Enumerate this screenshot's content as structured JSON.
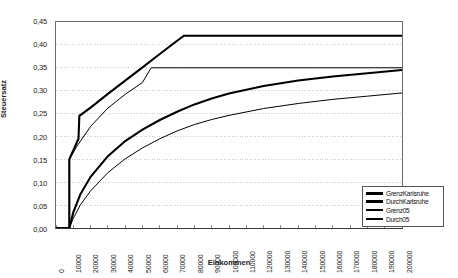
{
  "chart_data": {
    "type": "line",
    "title": "",
    "xlabel": "Einkommen",
    "ylabel": "Steuersatz",
    "xlim": [
      0,
      200000
    ],
    "ylim": [
      0,
      0.45
    ],
    "grid": "horizontal-dotted",
    "legend_position": "bottom-right",
    "x_ticks": [
      0,
      10000,
      20000,
      30000,
      40000,
      50000,
      60000,
      70000,
      80000,
      90000,
      100000,
      110000,
      120000,
      130000,
      140000,
      150000,
      160000,
      170000,
      180000,
      190000,
      200000
    ],
    "x_tick_labels": [
      "0",
      "10000",
      "20000",
      "30000",
      "40000",
      "50000",
      "60000",
      "70000",
      "80000",
      "90000",
      "100000",
      "110000",
      "120000",
      "130000",
      "140000",
      "150000",
      "160000",
      "170000",
      "180000",
      "190000",
      "200000"
    ],
    "y_ticks": [
      0,
      0.05,
      0.1,
      0.15,
      0.2,
      0.25,
      0.3,
      0.35,
      0.4,
      0.45
    ],
    "y_tick_labels": [
      "0,00",
      "0,05",
      "0,10",
      "0,15",
      "0,20",
      "0,25",
      "0,30",
      "0,35",
      "0,40",
      "0,45"
    ],
    "series": [
      {
        "name": "GrenzKarlsruhe",
        "color": "#000000",
        "width": 2.1,
        "points": [
          [
            0,
            0
          ],
          [
            7700,
            0
          ],
          [
            7700,
            0.15
          ],
          [
            13000,
            0.195
          ],
          [
            13500,
            0.245
          ],
          [
            20000,
            0.263
          ],
          [
            30000,
            0.293
          ],
          [
            40000,
            0.322
          ],
          [
            50000,
            0.351
          ],
          [
            60000,
            0.38
          ],
          [
            70000,
            0.409
          ],
          [
            74000,
            0.42
          ],
          [
            90000,
            0.42
          ],
          [
            120000,
            0.42
          ],
          [
            160000,
            0.42
          ],
          [
            200000,
            0.42
          ]
        ]
      },
      {
        "name": "DurchKarlsruhe",
        "color": "#000000",
        "width": 2.1,
        "points": [
          [
            0,
            0
          ],
          [
            7700,
            0
          ],
          [
            10000,
            0.034
          ],
          [
            14000,
            0.073
          ],
          [
            20000,
            0.112
          ],
          [
            30000,
            0.157
          ],
          [
            40000,
            0.19
          ],
          [
            50000,
            0.215
          ],
          [
            60000,
            0.236
          ],
          [
            70000,
            0.254
          ],
          [
            80000,
            0.27
          ],
          [
            90000,
            0.283
          ],
          [
            100000,
            0.294
          ],
          [
            120000,
            0.31
          ],
          [
            140000,
            0.322
          ],
          [
            160000,
            0.331
          ],
          [
            180000,
            0.338
          ],
          [
            200000,
            0.345
          ]
        ]
      },
      {
        "name": "Grenz05",
        "color": "#000000",
        "width": 1.0,
        "points": [
          [
            0,
            0
          ],
          [
            7700,
            0
          ],
          [
            7700,
            0.15
          ],
          [
            12000,
            0.178
          ],
          [
            20000,
            0.222
          ],
          [
            30000,
            0.262
          ],
          [
            40000,
            0.292
          ],
          [
            50000,
            0.318
          ],
          [
            55000,
            0.35
          ],
          [
            70000,
            0.35
          ],
          [
            100000,
            0.35
          ],
          [
            150000,
            0.35
          ],
          [
            200000,
            0.35
          ]
        ]
      },
      {
        "name": "Durch05",
        "color": "#000000",
        "width": 1.0,
        "points": [
          [
            0,
            0
          ],
          [
            7700,
            0
          ],
          [
            10000,
            0.021
          ],
          [
            14000,
            0.05
          ],
          [
            20000,
            0.081
          ],
          [
            30000,
            0.121
          ],
          [
            40000,
            0.151
          ],
          [
            50000,
            0.175
          ],
          [
            60000,
            0.195
          ],
          [
            70000,
            0.212
          ],
          [
            80000,
            0.226
          ],
          [
            90000,
            0.237
          ],
          [
            100000,
            0.246
          ],
          [
            120000,
            0.261
          ],
          [
            140000,
            0.272
          ],
          [
            160000,
            0.281
          ],
          [
            180000,
            0.288
          ],
          [
            200000,
            0.295
          ]
        ]
      }
    ],
    "legend_entries": [
      {
        "label": "GrenzKarlsruhe",
        "thickness": 3.0
      },
      {
        "label": "DurchKarlsruhe",
        "thickness": 3.0
      },
      {
        "label": "Grenz05",
        "thickness": 2.0
      },
      {
        "label": "Durch05",
        "thickness": 1.2
      }
    ]
  }
}
